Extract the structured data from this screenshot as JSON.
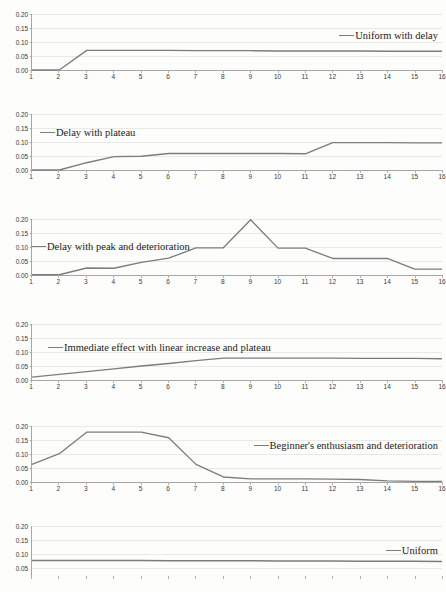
{
  "figure": {
    "background": "#fdfdfc",
    "line_color": "#7d7d7d",
    "axis_color": "#a6a6a6",
    "grid_color": "#e9e9e7"
  },
  "chart_data": [
    {
      "type": "line",
      "title": "",
      "legend": [
        "Uniform with delay"
      ],
      "legend_position": "right-upper",
      "xlabel": "",
      "ylabel": "",
      "x": [
        1,
        2,
        3,
        4,
        5,
        6,
        7,
        8,
        9,
        10,
        11,
        12,
        13,
        14,
        15,
        16
      ],
      "categories": [
        "1",
        "2",
        "3",
        "4",
        "5",
        "6",
        "7",
        "8",
        "9",
        "10",
        "11",
        "12",
        "13",
        "14",
        "15",
        "16"
      ],
      "yticks": [
        0.0,
        0.05,
        0.1,
        0.15,
        0.2
      ],
      "yticklabels": [
        "0.00",
        "0.05",
        "0.10",
        "0.15",
        "0.20"
      ],
      "ylim": [
        0.0,
        0.2
      ],
      "grid": true,
      "series": [
        {
          "name": "Uniform with delay",
          "values": [
            0.0,
            0.0,
            0.07,
            0.07,
            0.07,
            0.07,
            0.069,
            0.069,
            0.069,
            0.068,
            0.068,
            0.068,
            0.068,
            0.067,
            0.067,
            0.067
          ]
        }
      ]
    },
    {
      "type": "line",
      "title": "",
      "legend": [
        "Delay with plateau"
      ],
      "legend_position": "left-upper",
      "xlabel": "",
      "ylabel": "",
      "x": [
        1,
        2,
        3,
        4,
        5,
        6,
        7,
        8,
        9,
        10,
        11,
        12,
        13,
        14,
        15,
        16
      ],
      "categories": [
        "1",
        "2",
        "3",
        "4",
        "5",
        "6",
        "7",
        "8",
        "9",
        "10",
        "11",
        "12",
        "13",
        "14",
        "15",
        "16"
      ],
      "yticks": [
        0.0,
        0.05,
        0.1,
        0.15,
        0.2
      ],
      "yticklabels": [
        "0.00",
        "0.05",
        "0.10",
        "0.15",
        "0.20"
      ],
      "ylim": [
        0.0,
        0.2
      ],
      "grid": true,
      "series": [
        {
          "name": "Delay with plateau",
          "values": [
            0.0,
            0.0,
            0.026,
            0.048,
            0.049,
            0.059,
            0.059,
            0.059,
            0.059,
            0.059,
            0.058,
            0.098,
            0.098,
            0.098,
            0.097,
            0.097
          ]
        }
      ]
    },
    {
      "type": "line",
      "title": "",
      "legend": [
        "Delay with peak and deterioration"
      ],
      "legend_position": "left-upper",
      "xlabel": "",
      "ylabel": "",
      "x": [
        1,
        2,
        3,
        4,
        5,
        6,
        7,
        8,
        9,
        10,
        11,
        12,
        13,
        14,
        15,
        16
      ],
      "categories": [
        "1",
        "2",
        "3",
        "4",
        "5",
        "6",
        "7",
        "8",
        "9",
        "10",
        "11",
        "12",
        "13",
        "14",
        "15",
        "16"
      ],
      "yticks": [
        0.0,
        0.05,
        0.1,
        0.15,
        0.2
      ],
      "yticklabels": [
        "0.00",
        "0.05",
        "0.10",
        "0.15",
        "0.20"
      ],
      "ylim": [
        0.0,
        0.2
      ],
      "grid": true,
      "series": [
        {
          "name": "Delay with peak and deterioration",
          "values": [
            0.001,
            0.001,
            0.025,
            0.024,
            0.045,
            0.06,
            0.097,
            0.097,
            0.197,
            0.096,
            0.096,
            0.059,
            0.059,
            0.059,
            0.021,
            0.021
          ]
        }
      ]
    },
    {
      "type": "line",
      "title": "",
      "legend": [
        "Immediate effect with linear increase and plateau"
      ],
      "legend_position": "left-upper",
      "xlabel": "",
      "ylabel": "",
      "x": [
        1,
        2,
        3,
        4,
        5,
        6,
        7,
        8,
        9,
        10,
        11,
        12,
        13,
        14,
        15,
        16
      ],
      "categories": [
        "1",
        "2",
        "3",
        "4",
        "5",
        "6",
        "7",
        "8",
        "9",
        "10",
        "11",
        "12",
        "13",
        "14",
        "15",
        "16"
      ],
      "yticks": [
        0.0,
        0.05,
        0.1,
        0.15,
        0.2
      ],
      "yticklabels": [
        "0.00",
        "0.05",
        "0.10",
        "0.15",
        "0.20"
      ],
      "ylim": [
        0.0,
        0.2
      ],
      "grid": true,
      "series": [
        {
          "name": "Immediate effect with linear increase and plateau",
          "values": [
            0.01,
            0.02,
            0.03,
            0.04,
            0.05,
            0.059,
            0.069,
            0.078,
            0.078,
            0.078,
            0.078,
            0.078,
            0.077,
            0.077,
            0.077,
            0.076
          ]
        }
      ]
    },
    {
      "type": "line",
      "title": "",
      "legend": [
        "Beginner's enthusiasm and deterioration"
      ],
      "legend_position": "right-middle",
      "xlabel": "",
      "ylabel": "",
      "x": [
        1,
        2,
        3,
        4,
        5,
        6,
        7,
        8,
        9,
        10,
        11,
        12,
        13,
        14,
        15,
        16
      ],
      "categories": [
        "1",
        "2",
        "3",
        "4",
        "5",
        "6",
        "7",
        "8",
        "9",
        "10",
        "11",
        "12",
        "13",
        "14",
        "15",
        "16"
      ],
      "yticks": [
        0.0,
        0.05,
        0.1,
        0.15,
        0.2
      ],
      "yticklabels": [
        "0.00",
        "0.05",
        "0.10",
        "0.15",
        "0.20"
      ],
      "ylim": [
        0.0,
        0.2
      ],
      "grid": true,
      "series": [
        {
          "name": "Beginner's enthusiasm and deterioration",
          "values": [
            0.063,
            0.101,
            0.178,
            0.178,
            0.178,
            0.158,
            0.063,
            0.018,
            0.011,
            0.011,
            0.011,
            0.01,
            0.009,
            0.004,
            0.002,
            0.002
          ]
        }
      ]
    },
    {
      "type": "line",
      "title": "",
      "legend": [
        "Uniform"
      ],
      "legend_position": "right-middle",
      "xlabel": "",
      "ylabel": "",
      "x": [
        1,
        2,
        3,
        4,
        5,
        6,
        7,
        8,
        9,
        10,
        11,
        12,
        13,
        14,
        15,
        16
      ],
      "categories": [
        "1",
        "2",
        "3",
        "4",
        "5",
        "6",
        "7",
        "8",
        "9",
        "10",
        "11",
        "12",
        "13",
        "14",
        "15",
        "16"
      ],
      "yticks": [
        0.0,
        0.05,
        0.1,
        0.15,
        0.2
      ],
      "yticklabels": [
        "0.00",
        "0.05",
        "0.10",
        "0.15",
        "0.20"
      ],
      "ylim": [
        0.0,
        0.2
      ],
      "grid": true,
      "clipped_bottom": true,
      "series": [
        {
          "name": "Uniform",
          "values": [
            0.062,
            0.062,
            0.062,
            0.062,
            0.062,
            0.061,
            0.061,
            0.061,
            0.061,
            0.06,
            0.06,
            0.06,
            0.059,
            0.059,
            0.059,
            0.058
          ]
        }
      ]
    }
  ]
}
